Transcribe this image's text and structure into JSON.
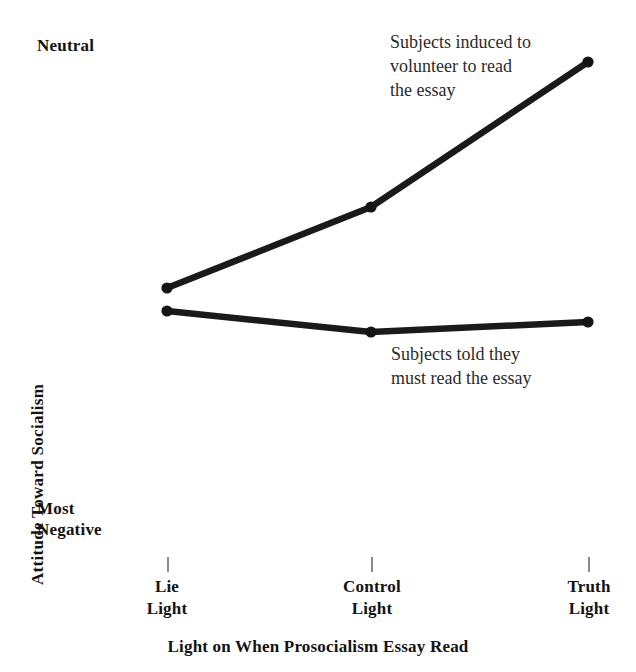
{
  "chart_data": {
    "type": "line",
    "title": "",
    "xlabel": "Light on When Prosocialism Essay Read",
    "ylabel": "Attitude Toward Socialism",
    "categories": [
      "Lie\nLight",
      "Control\nLight",
      "Truth\nLight"
    ],
    "category_labels_flat": [
      "Lie Light",
      "Control Light",
      "Truth Light"
    ],
    "y_axis_top_label": "Neutral",
    "y_axis_bottom_label": "Most\nNegative",
    "y_axis_ticks": [],
    "grid": false,
    "legend_position": "inline-annotation",
    "x_pixels": [
      167,
      371,
      588
    ],
    "y_range_pixels": [
      50,
      545
    ],
    "series": [
      {
        "name": "Subjects induced to\nvolunteer to read\nthe essay",
        "name_flat": "Subjects induced to volunteer to read the essay",
        "values": [
          -0.48,
          -0.32,
          0.0
        ],
        "y_pixels": [
          288,
          207,
          62
        ],
        "color": "#1a1a1a",
        "annotation": "Subjects induced to\nvolunteer to read\nthe essay",
        "annotation_x": 390,
        "annotation_y": 30
      },
      {
        "name": "Subjects told they\nmust read the essay",
        "name_flat": "Subjects told they must read the essay",
        "values": [
          -0.53,
          -0.58,
          -0.56
        ],
        "y_pixels": [
          311,
          332,
          322
        ],
        "color": "#1a1a1a",
        "annotation": "Subjects told they\nmust read the essay",
        "annotation_x": 391,
        "annotation_y": 342
      }
    ]
  },
  "axis": {
    "neutral_label": "Neutral",
    "most_negative_label": "Most\nNegative",
    "y_title": "Attitude Toward Socialism",
    "x_title": "Light on When Prosocialism Essay Read",
    "tick_lie": "Lie\nLight",
    "tick_control": "Control\nLight",
    "tick_truth": "Truth\nLight"
  },
  "annotations": {
    "volunteer": "Subjects induced to\nvolunteer to read\nthe essay",
    "told": "Subjects told they\nmust read the essay"
  },
  "colors": {
    "line": "#1a1a1a",
    "marker": "#141414",
    "tick": "#8a8a8a",
    "text": "#131313",
    "annotation_text": "#2b2b2b",
    "background": "#ffffff"
  }
}
